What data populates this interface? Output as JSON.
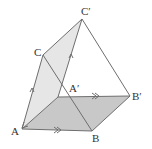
{
  "diagram": {
    "type": "geometry-translation-prism",
    "labels": {
      "A": "A",
      "B": "B",
      "C": "C",
      "A_prime": "A′",
      "B_prime": "B′",
      "C_prime": "C′"
    },
    "points": {
      "A": [
        22,
        129
      ],
      "B": [
        92,
        131
      ],
      "C": [
        43,
        55
      ],
      "A_prime": [
        58,
        97
      ],
      "B_prime": [
        130,
        96
      ],
      "C_prime": [
        82,
        19
      ]
    },
    "faces": [
      {
        "name": "base-parallelogram",
        "vertices": [
          "A",
          "B",
          "B_prime",
          "A_prime"
        ],
        "fill": "#c8c8c8"
      },
      {
        "name": "side-parallelogram",
        "vertices": [
          "A",
          "A_prime",
          "C_prime",
          "C"
        ],
        "fill": "#e6e6e6"
      }
    ],
    "colors": {
      "stroke": "#6e6e6e",
      "base_fill": "#c8c8c8",
      "side_fill": "#e6e6e6"
    },
    "markers": {
      "single_arrow": "parallel-mark AC / A'C'",
      "double_arrow": "parallel-mark AB / A'B'"
    }
  }
}
